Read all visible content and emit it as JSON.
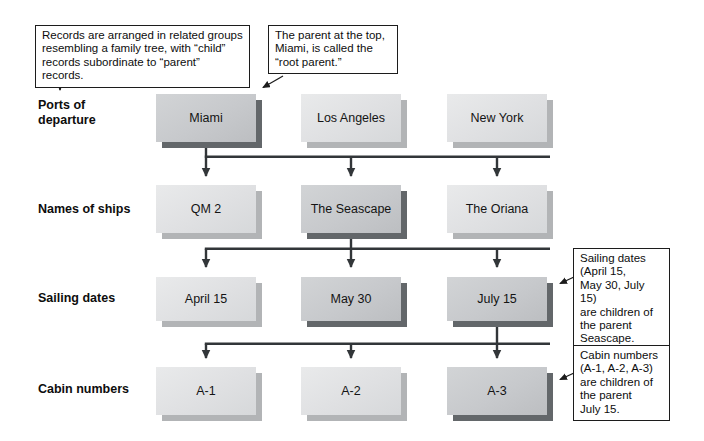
{
  "figure": {
    "type": "hierarchical-database-diagram",
    "colors": {
      "background": "#ffffff",
      "node_light_face": "#e2e3e5",
      "node_light_shadow": "#b2b4b6",
      "node_highlight_face": "#c8cacc",
      "node_highlight_shadow": "#63676a",
      "connector_line": "#323639",
      "callout_border": "#1c1c1c",
      "callout_background": "#ffffff"
    }
  },
  "diagram": {
    "annotations": [
      {
        "id": "family-tree-note",
        "text": "Records are arranged in related groups\nresembling a family tree, with “child”\nrecords subordinate to “parent” records."
      },
      {
        "id": "root-parent-note",
        "text": "The parent at the top,\nMiami, is called the\n“root parent.”"
      },
      {
        "id": "sailing-dates-note",
        "text": "Sailing dates\n(April 15,\nMay 30, July 15)\nare children of\nthe parent\nSeascape."
      },
      {
        "id": "cabin-numbers-note",
        "text": "Cabin numbers\n(A-1, A-2, A-3)\nare children of\nthe parent\nJuly 15."
      }
    ],
    "rows": [
      {
        "label": "Ports of\ndeparture",
        "nodes": [
          {
            "label": "Miami",
            "highlighted": true
          },
          {
            "label": "Los Angeles",
            "highlighted": false
          },
          {
            "label": "New York",
            "highlighted": false
          }
        ]
      },
      {
        "label": "Names of ships",
        "nodes": [
          {
            "label": "QM 2",
            "highlighted": false
          },
          {
            "label": "The Seascape",
            "highlighted": true
          },
          {
            "label": "The Oriana",
            "highlighted": false
          }
        ]
      },
      {
        "label": "Sailing dates",
        "nodes": [
          {
            "label": "April 15",
            "highlighted": false
          },
          {
            "label": "May 30",
            "highlighted": true
          },
          {
            "label": "July 15",
            "highlighted": true
          }
        ]
      },
      {
        "label": "Cabin numbers",
        "nodes": [
          {
            "label": "A-1",
            "highlighted": false
          },
          {
            "label": "A-2",
            "highlighted": false
          },
          {
            "label": "A-3",
            "highlighted": true
          }
        ]
      }
    ]
  }
}
